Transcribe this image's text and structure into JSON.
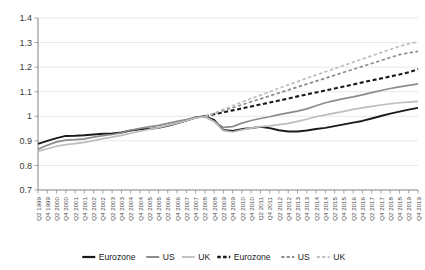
{
  "chart_data": {
    "type": "line",
    "title": "",
    "xlabel": "",
    "ylabel": "",
    "ylim": [
      0.7,
      1.4
    ],
    "yticks": [
      0.7,
      0.8,
      0.9,
      1,
      1.1,
      1.2,
      1.3,
      1.4
    ],
    "ytick_labels": [
      "0.7",
      "0.8",
      "0.9",
      "1",
      "1.1",
      "1.2",
      "1.3",
      "1.4"
    ],
    "grid": true,
    "legend_position": "bottom",
    "categories": [
      "Q2 1999",
      "Q4 1999",
      "Q2 2000",
      "Q4 2000",
      "Q2 2001",
      "Q4 2001",
      "Q2 2002",
      "Q4 2002",
      "Q2 2003",
      "Q4 2003",
      "Q2 2004",
      "Q4 2004",
      "Q2 2005",
      "Q4 2005",
      "Q2 2006",
      "Q4 2006",
      "Q2 2007",
      "Q4 2007",
      "Q2 2008",
      "Q4 2008",
      "Q2 2009",
      "Q4 2009",
      "Q2 2010",
      "Q4 2010",
      "Q2 2011",
      "Q4 2011",
      "Q2 2012",
      "Q4 2012",
      "Q2 2013",
      "Q4 2013",
      "Q2 2014",
      "Q4 2014",
      "Q2 2015",
      "Q4 2015",
      "Q2 2016",
      "Q4 2016",
      "Q2 2017",
      "Q4 2017",
      "Q2 2018",
      "Q4 2018",
      "Q2 2019",
      "Q4 2019"
    ],
    "series": [
      {
        "name": "Eurozone",
        "style": "solid",
        "color": "#1a1a1a",
        "width": 1.9,
        "values": [
          0.888,
          0.9,
          0.911,
          0.92,
          0.921,
          0.923,
          0.926,
          0.929,
          0.93,
          0.934,
          0.942,
          0.947,
          0.949,
          0.953,
          0.961,
          0.971,
          0.982,
          0.995,
          1.0,
          0.985,
          0.944,
          0.94,
          0.948,
          0.952,
          0.957,
          0.952,
          0.943,
          0.938,
          0.938,
          0.942,
          0.948,
          0.953,
          0.96,
          0.967,
          0.974,
          0.981,
          0.991,
          1.001,
          1.011,
          1.019,
          1.027,
          1.034
        ]
      },
      {
        "name": "US",
        "style": "solid",
        "color": "#8c8c8c",
        "width": 1.7,
        "values": [
          0.866,
          0.882,
          0.896,
          0.903,
          0.905,
          0.908,
          0.915,
          0.921,
          0.926,
          0.933,
          0.943,
          0.951,
          0.957,
          0.963,
          0.971,
          0.979,
          0.987,
          0.996,
          0.999,
          0.98,
          0.955,
          0.958,
          0.972,
          0.983,
          0.991,
          0.998,
          1.007,
          1.014,
          1.021,
          1.03,
          1.043,
          1.055,
          1.064,
          1.072,
          1.079,
          1.087,
          1.096,
          1.105,
          1.113,
          1.12,
          1.126,
          1.132
        ]
      },
      {
        "name": "UK",
        "style": "solid",
        "color": "#bdbdbd",
        "width": 1.7,
        "values": [
          0.857,
          0.868,
          0.878,
          0.885,
          0.889,
          0.894,
          0.901,
          0.909,
          0.915,
          0.922,
          0.931,
          0.939,
          0.947,
          0.954,
          0.963,
          0.972,
          0.982,
          0.993,
          0.998,
          0.978,
          0.942,
          0.936,
          0.945,
          0.952,
          0.958,
          0.961,
          0.966,
          0.971,
          0.979,
          0.988,
          0.998,
          1.006,
          1.013,
          1.02,
          1.028,
          1.034,
          1.04,
          1.046,
          1.051,
          1.055,
          1.058,
          1.061
        ]
      },
      {
        "name": "Eurozone",
        "style": "dashed",
        "color": "#1a1a1a",
        "width": 2.1,
        "dash": "4,2.6",
        "values": [
          null,
          null,
          null,
          null,
          null,
          null,
          null,
          null,
          null,
          null,
          null,
          null,
          null,
          null,
          null,
          null,
          null,
          null,
          1.0,
          1.008,
          1.016,
          1.024,
          1.032,
          1.04,
          1.048,
          1.056,
          1.064,
          1.072,
          1.081,
          1.089,
          1.097,
          1.105,
          1.113,
          1.121,
          1.129,
          1.138,
          1.146,
          1.154,
          1.162,
          1.17,
          1.179,
          1.192
        ]
      },
      {
        "name": "US",
        "style": "dashed",
        "color": "#8c8c8c",
        "width": 1.7,
        "dash": "3.4,2.4",
        "values": [
          null,
          null,
          null,
          null,
          null,
          null,
          null,
          null,
          null,
          null,
          null,
          null,
          null,
          null,
          null,
          null,
          null,
          null,
          0.999,
          1.011,
          1.023,
          1.035,
          1.047,
          1.059,
          1.071,
          1.083,
          1.095,
          1.107,
          1.119,
          1.131,
          1.143,
          1.155,
          1.167,
          1.179,
          1.191,
          1.203,
          1.215,
          1.227,
          1.239,
          1.251,
          1.258,
          1.264
        ]
      },
      {
        "name": "UK",
        "style": "dashed",
        "color": "#bdbdbd",
        "width": 1.7,
        "dash": "3.4,2.4",
        "values": [
          null,
          null,
          null,
          null,
          null,
          null,
          null,
          null,
          null,
          null,
          null,
          null,
          null,
          null,
          null,
          null,
          null,
          null,
          0.998,
          1.013,
          1.028,
          1.043,
          1.058,
          1.072,
          1.086,
          1.1,
          1.114,
          1.128,
          1.141,
          1.155,
          1.168,
          1.181,
          1.194,
          1.207,
          1.22,
          1.233,
          1.246,
          1.259,
          1.272,
          1.285,
          1.295,
          1.303
        ]
      }
    ],
    "legend": [
      {
        "label": "Eurozone",
        "style": "solid",
        "color": "#1a1a1a",
        "width": 2.2
      },
      {
        "label": "US",
        "style": "solid",
        "color": "#8c8c8c",
        "width": 2.0
      },
      {
        "label": "UK",
        "style": "solid",
        "color": "#c2c2c2",
        "width": 2.0
      },
      {
        "label": "Eurozone",
        "style": "dashed",
        "color": "#1a1a1a",
        "width": 2.4,
        "dash": "3.6,2.2"
      },
      {
        "label": "US",
        "style": "dashed",
        "color": "#8c8c8c",
        "width": 2.0,
        "dash": "3.2,2.2"
      },
      {
        "label": "UK",
        "style": "dashed",
        "color": "#c2c2c2",
        "width": 2.0,
        "dash": "3.2,2.2"
      }
    ]
  },
  "layout": {
    "plot_left": 38,
    "plot_right": 418,
    "plot_top": 18,
    "plot_bottom": 190,
    "legend_y": 257
  }
}
